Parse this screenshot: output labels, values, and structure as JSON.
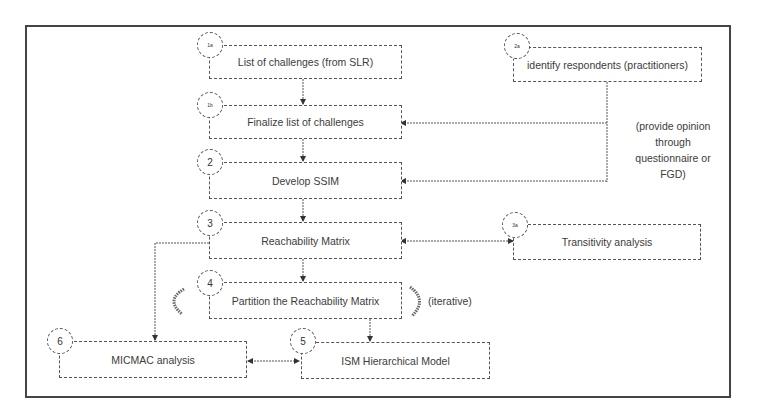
{
  "diagram": {
    "nodes": [
      {
        "id": "list",
        "step": "1a",
        "label": "List of challenges (from SLR)"
      },
      {
        "id": "finalize",
        "step": "1b",
        "label": "Finalize list of challenges"
      },
      {
        "id": "respondents",
        "step": "2a",
        "label": "identify respondents (practitioners)"
      },
      {
        "id": "ssim",
        "step": "2",
        "label": "Develop SSIM"
      },
      {
        "id": "reach",
        "step": "3",
        "label": "Reachability Matrix"
      },
      {
        "id": "transitivity",
        "step": "3a",
        "label": "Transitivity analysis"
      },
      {
        "id": "partition",
        "step": "4",
        "label": "Partition the Reachability Matrix"
      },
      {
        "id": "ism",
        "step": "5",
        "label": "ISM Hierarchical Model"
      },
      {
        "id": "micmac",
        "step": "6",
        "label": "MICMAC analysis"
      }
    ],
    "notes": {
      "opinion": [
        "(provide opinion",
        "through",
        "questionnaire or",
        "FGD)"
      ],
      "iterative": "(iterative)"
    },
    "edges": [
      {
        "from": "list",
        "to": "finalize"
      },
      {
        "from": "finalize",
        "to": "ssim"
      },
      {
        "from": "ssim",
        "to": "reach"
      },
      {
        "from": "reach",
        "to": "partition"
      },
      {
        "from": "partition",
        "to": "ism"
      },
      {
        "from": "respondents",
        "to": "finalize"
      },
      {
        "from": "respondents",
        "to": "ssim"
      },
      {
        "from": "reach",
        "to": "transitivity",
        "bidirectional": true
      },
      {
        "from": "reach",
        "to": "micmac"
      },
      {
        "from": "micmac",
        "to": "ism",
        "bidirectional": true
      }
    ]
  }
}
